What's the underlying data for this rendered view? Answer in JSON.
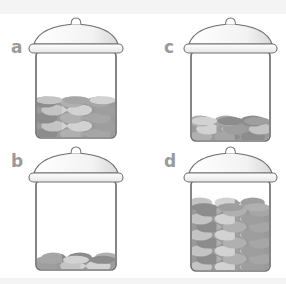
{
  "jars": [
    {
      "label": "a",
      "fill_fraction": 0.48
    },
    {
      "label": "b",
      "fill_fraction": 0.15
    },
    {
      "label": "c",
      "fill_fraction": 0.26
    },
    {
      "label": "d",
      "fill_fraction": 0.75
    }
  ],
  "colors": {
    "outline": "#707070",
    "label": "#9a9a9a",
    "fish_tones": [
      "#8c8c8c",
      "#9e9e9e",
      "#b0b0b0",
      "#c4c4c4",
      "#a6a6a6",
      "#d2d2d2"
    ],
    "band": "#f4f4f4"
  }
}
